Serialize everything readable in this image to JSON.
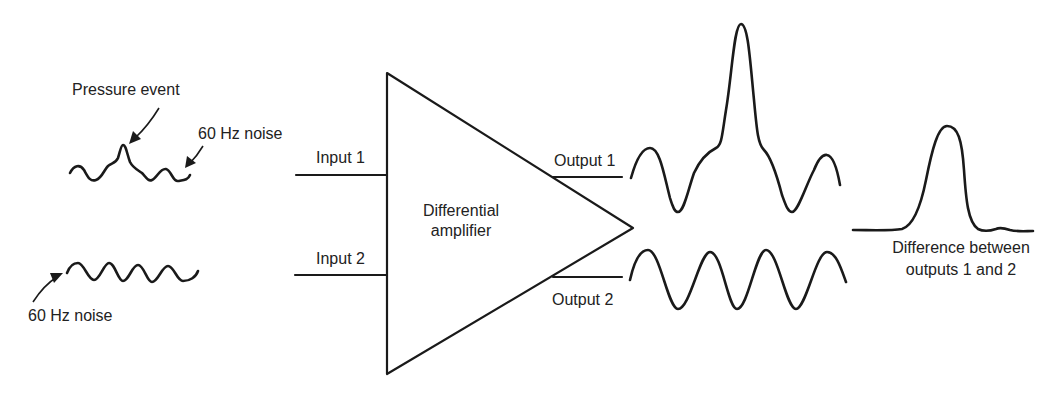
{
  "colors": {
    "background": "#ffffff",
    "ink": "#1a1a1a",
    "text": "#222222"
  },
  "input_signals": {
    "signal_1": {
      "annotation_event": "Pressure event",
      "annotation_noise": "60 Hz noise"
    },
    "signal_2": {
      "annotation_noise": "60 Hz noise"
    }
  },
  "amplifier": {
    "label_line1": "Differential",
    "label_line2": "amplifier",
    "input_1_label": "Input 1",
    "input_2_label": "Input 2",
    "output_1_label": "Output 1",
    "output_2_label": "Output 2"
  },
  "result": {
    "label_line1": "Difference between",
    "label_line2": "outputs 1 and 2"
  }
}
